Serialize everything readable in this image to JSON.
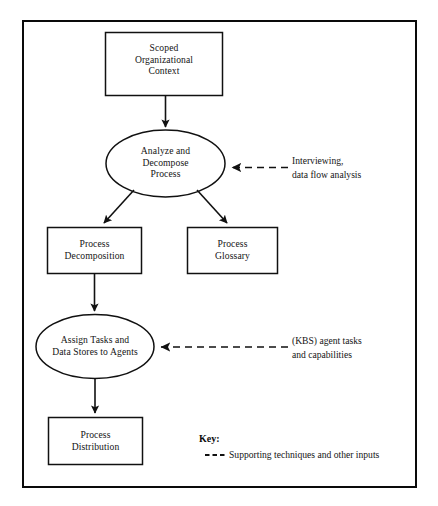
{
  "figure": {
    "type": "flowchart",
    "orientation": "top-to-bottom",
    "border_color": "#0a0a0a",
    "node_fill": "#ffffff",
    "line_color": "#111111"
  },
  "nodes": {
    "scoped_context": {
      "shape": "rectangle",
      "line1": "Scoped",
      "line2": "Organizational",
      "line3": "Context"
    },
    "analyze_decompose": {
      "shape": "ellipse",
      "line1": "Analyze and",
      "line2": "Decompose",
      "line3": "Process"
    },
    "process_decomposition": {
      "shape": "rectangle",
      "line1": "Process",
      "line2": "Decomposition"
    },
    "process_glossary": {
      "shape": "rectangle",
      "line1": "Process",
      "line2": "Glossary"
    },
    "assign_tasks": {
      "shape": "ellipse",
      "line1": "Assign Tasks and",
      "line2": "Data Stores to Agents"
    },
    "process_distribution": {
      "shape": "rectangle",
      "line1": "Process",
      "line2": "Distribution"
    }
  },
  "annotations": {
    "interviewing": {
      "line1": "Interviewing,",
      "line2": "data flow analysis"
    },
    "kbs": {
      "line1": "(KBS) agent tasks",
      "line2": "and capabilities"
    }
  },
  "key": {
    "title": "Key:",
    "legend_text": "Supporting techniques and other inputs",
    "legend_style": "dashed"
  }
}
